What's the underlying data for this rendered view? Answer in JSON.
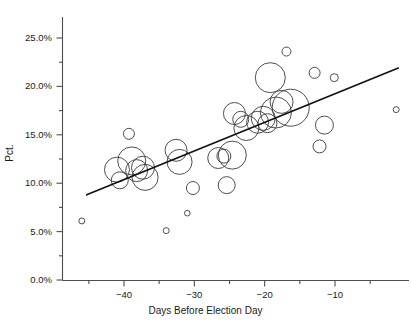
{
  "chart_data": {
    "type": "scatter",
    "title": "",
    "xlabel": "Days Before Election Day",
    "ylabel": "Pct.",
    "xlim": [
      -46.5,
      -0.5
    ],
    "ylim": [
      0,
      27.5
    ],
    "grid": false,
    "legend": "none",
    "note": "Bubble scatter: marker area encodes an unlabeled weight; open circles with a fitted least-squares trend line.",
    "xticks": [
      -40,
      -30,
      -20,
      -10
    ],
    "xtick_labels": [
      "−40",
      "−30",
      "−20",
      "−10"
    ],
    "x_minor_ticks": [
      -45,
      -35,
      -25,
      -15,
      -5
    ],
    "yticks": [
      0,
      5,
      10,
      15,
      20,
      25
    ],
    "ytick_labels": [
      "0.0%",
      "5.0%",
      "10.0%",
      "15.0%",
      "20.0%",
      "25.0%"
    ],
    "y_minor_ticks": [
      2.5,
      7.5,
      12.5,
      17.5,
      22.5,
      27.5
    ],
    "series": [
      {
        "name": "polls",
        "marker": "open-circle",
        "color": "#3a3a3a",
        "points": [
          {
            "x": -46.0,
            "y": 6.1,
            "r": 3.0
          },
          {
            "x": -41.0,
            "y": 11.4,
            "r": 12.5
          },
          {
            "x": -40.6,
            "y": 10.3,
            "r": 8.5
          },
          {
            "x": -39.3,
            "y": 15.1,
            "r": 5.5
          },
          {
            "x": -38.9,
            "y": 12.3,
            "r": 14.0
          },
          {
            "x": -38.2,
            "y": 11.3,
            "r": 11.0
          },
          {
            "x": -37.3,
            "y": 11.6,
            "r": 11.5
          },
          {
            "x": -37.0,
            "y": 10.6,
            "r": 13.0
          },
          {
            "x": -34.0,
            "y": 5.1,
            "r": 3.0
          },
          {
            "x": -32.6,
            "y": 13.4,
            "r": 11.0
          },
          {
            "x": -32.1,
            "y": 12.2,
            "r": 12.5
          },
          {
            "x": -31.0,
            "y": 6.9,
            "r": 2.8
          },
          {
            "x": -30.2,
            "y": 9.5,
            "r": 6.5
          },
          {
            "x": -26.6,
            "y": 12.6,
            "r": 10.5
          },
          {
            "x": -25.8,
            "y": 12.8,
            "r": 7.0
          },
          {
            "x": -25.4,
            "y": 9.8,
            "r": 8.5
          },
          {
            "x": -24.6,
            "y": 12.9,
            "r": 14.0
          },
          {
            "x": -24.3,
            "y": 17.2,
            "r": 11.0
          },
          {
            "x": -23.4,
            "y": 16.6,
            "r": 8.0
          },
          {
            "x": -22.6,
            "y": 15.7,
            "r": 12.5
          },
          {
            "x": -21.0,
            "y": 16.3,
            "r": 11.0
          },
          {
            "x": -20.2,
            "y": 16.7,
            "r": 12.0
          },
          {
            "x": -19.6,
            "y": 16.2,
            "r": 9.5
          },
          {
            "x": -19.2,
            "y": 20.9,
            "r": 15.0
          },
          {
            "x": -18.4,
            "y": 17.3,
            "r": 15.5
          },
          {
            "x": -17.6,
            "y": 18.4,
            "r": 11.5
          },
          {
            "x": -16.9,
            "y": 23.6,
            "r": 4.5
          },
          {
            "x": -16.3,
            "y": 17.8,
            "r": 18.5
          },
          {
            "x": -12.9,
            "y": 21.4,
            "r": 5.5
          },
          {
            "x": -12.2,
            "y": 13.8,
            "r": 6.5
          },
          {
            "x": -11.5,
            "y": 16.0,
            "r": 9.0
          },
          {
            "x": -10.1,
            "y": 20.9,
            "r": 4.0
          },
          {
            "x": -1.3,
            "y": 17.6,
            "r": 3.0
          }
        ]
      }
    ],
    "trend_line": {
      "name": "fitted-regression-line",
      "color": "#111111",
      "x_start": -45.3,
      "y_start": 8.8,
      "x_end": -1.0,
      "y_end": 21.9
    }
  },
  "axes": {
    "y_title": "Pct.",
    "x_title": "Days Before Election Day"
  }
}
